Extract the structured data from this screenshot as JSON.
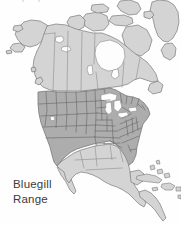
{
  "figure": {
    "kind": "species-distribution-map",
    "width": 181,
    "height": 225,
    "background_color": "#fefefe"
  },
  "caption": {
    "line1": "Bluegill",
    "line2": "Range",
    "text_color": "#3b3b3b"
  },
  "legend_semantics": {
    "range_fill_color": "#adadad",
    "range_meaning": "Bluegill Range",
    "outside_fill_color": "#d4d4d4",
    "outside_meaning": "Land outside range",
    "water_fill_color": "#fdfdfd",
    "water_meaning": "Water",
    "border_color": "#6d6d6d"
  },
  "map_content": {
    "continent": "North America",
    "projection_note": "conic, North America centered",
    "regions_shaded_as_range": [
      "Contiguous United States"
    ],
    "regions_unshaded": [
      "Alaska",
      "Canada",
      "Greenland",
      "Mexico",
      "Central America",
      "Cuba",
      "Hispaniola",
      "Puerto Rico",
      "Bahamas"
    ],
    "water_features": [
      "Hudson Bay",
      "Great Lakes",
      "Gulf of Mexico",
      "Pacific Ocean",
      "Atlantic Ocean",
      "Great Salt Lake"
    ],
    "internal_boundaries": [
      "US state borders",
      "Canadian province borders"
    ]
  }
}
